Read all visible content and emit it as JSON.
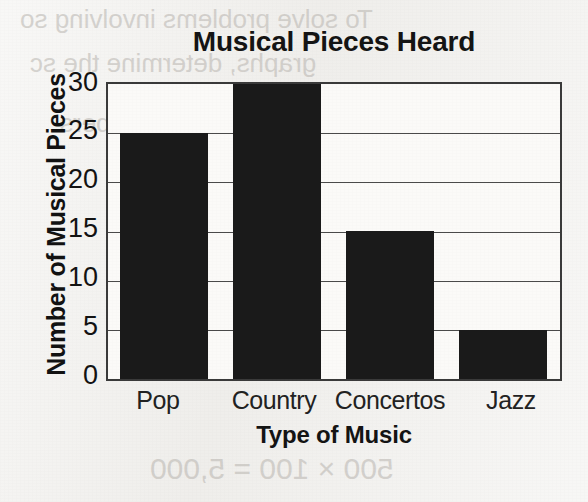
{
  "chart_data": {
    "type": "bar",
    "title": "Musical Pieces Heard",
    "xlabel": "Type of Music",
    "ylabel": "Number of Musical Pieces",
    "categories": [
      "Pop",
      "Country",
      "Concertos",
      "Jazz"
    ],
    "values": [
      25,
      30,
      15,
      5
    ],
    "ylim": [
      0,
      30
    ],
    "ytick_labels": [
      "0",
      "5",
      "10",
      "15",
      "20",
      "25",
      "30"
    ],
    "ytick_values": [
      0,
      5,
      10,
      15,
      20,
      25,
      30
    ],
    "grid": true,
    "legend": false,
    "bar_color": "#1a1a1a",
    "axis_color": "#3a3a3a",
    "background_color": "#fbfaf8"
  },
  "page": {
    "paper_color": "#f0efec",
    "bleed_through": [
      "To solve problems involving so",
      "graphs, determine the sc",
      "determine the numbers",
      "by each bar",
      "Example",
      "tuba",
      "fife",
      "500  × 100 = 5,000"
    ]
  }
}
